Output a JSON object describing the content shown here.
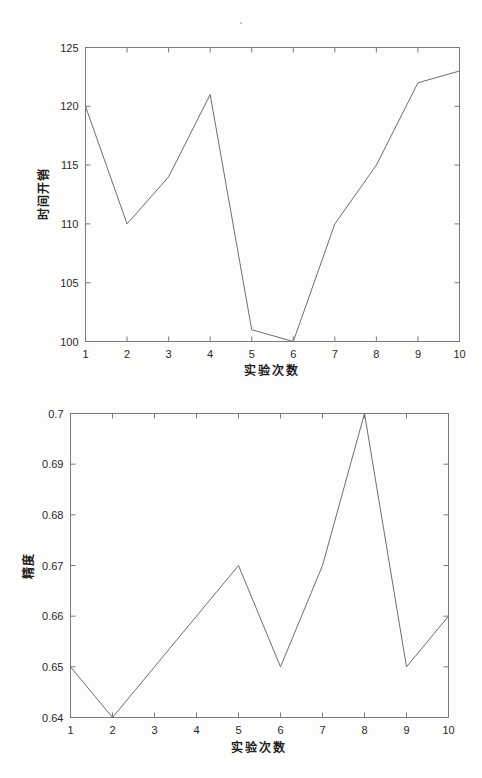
{
  "document": {
    "kind": "scanned-figure-page",
    "background_color": "#fdfdfc",
    "ink_color": "#6e6e6e"
  },
  "charts": [
    {
      "id": "time-overhead-chart",
      "name": "time-overhead-line-chart"
    },
    {
      "id": "accuracy-chart",
      "name": "accuracy-line-chart"
    }
  ],
  "chart_data": [
    {
      "type": "line",
      "title": "",
      "xlabel": "实验次数",
      "ylabel": "时间开销",
      "x": [
        1,
        2,
        3,
        4,
        5,
        6,
        7,
        8,
        9,
        10
      ],
      "values": [
        120,
        110,
        114,
        121,
        101,
        100,
        110,
        115,
        122,
        123
      ],
      "xticklabels": [
        "1",
        "2",
        "3",
        "4",
        "5",
        "6",
        "7",
        "8",
        "9",
        "10"
      ],
      "yticklabels": [
        "100",
        "105",
        "110",
        "115",
        "120",
        "125"
      ],
      "yticks": [
        100,
        105,
        110,
        115,
        120,
        125
      ],
      "xlim": [
        1,
        10
      ],
      "ylim": [
        100,
        125
      ],
      "grid": false,
      "legend": false,
      "line_color": "#6e6e6e",
      "markers": false
    },
    {
      "type": "line",
      "title": "",
      "xlabel": "实验次数",
      "ylabel": "精度",
      "x": [
        1,
        2,
        3,
        4,
        5,
        6,
        7,
        8,
        9,
        10
      ],
      "values": [
        0.65,
        0.64,
        0.65,
        0.66,
        0.67,
        0.65,
        0.67,
        0.7,
        0.65,
        0.66
      ],
      "xticklabels": [
        "1",
        "2",
        "3",
        "4",
        "5",
        "6",
        "7",
        "8",
        "9",
        "10"
      ],
      "yticklabels": [
        "0.64",
        "0.65",
        "0.66",
        "0.67",
        "0.68",
        "0.69",
        "0.7"
      ],
      "yticks": [
        0.64,
        0.65,
        0.66,
        0.67,
        0.68,
        0.69,
        0.7
      ],
      "xlim": [
        1,
        10
      ],
      "ylim": [
        0.64,
        0.7
      ],
      "grid": false,
      "legend": false,
      "line_color": "#6e6e6e",
      "markers": false
    }
  ]
}
